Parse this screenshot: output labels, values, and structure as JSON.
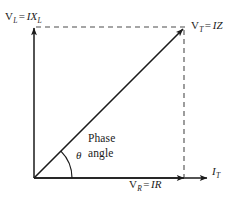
{
  "figure": {
    "kind": "phasor-diagram",
    "stroke_color": "#1a1a1a",
    "dash_color": "#4d4d4d",
    "background": "#ffffff"
  },
  "axes": {
    "vertical": {
      "name": "inductive-voltage-axis",
      "label_quantity": "V",
      "label_quantity_sub": "L",
      "label_equals": "=",
      "label_value": "IX",
      "label_value_sub": "L"
    },
    "horizontal": {
      "name": "current-axis",
      "label_value": "I",
      "label_value_sub": "T"
    }
  },
  "vectors": {
    "resultant": {
      "name": "total-voltage-vector",
      "label_quantity": "V",
      "label_quantity_sub": "T",
      "label_equals": "=",
      "label_value": "IZ"
    },
    "resistive": {
      "name": "resistive-voltage-vector",
      "label_quantity": "V",
      "label_quantity_sub": "R",
      "label_equals": "=",
      "label_value": "IR"
    }
  },
  "annotations": {
    "angle_symbol": "θ",
    "phase_line1": "Phase",
    "phase_line2": "angle"
  },
  "geometry": {
    "origin_x": 34,
    "origin_y": 178,
    "corner_x": 184,
    "corner_y": 28,
    "axis_tip_x": 207,
    "axis_tip_y": 26,
    "arc_radius": 38
  }
}
